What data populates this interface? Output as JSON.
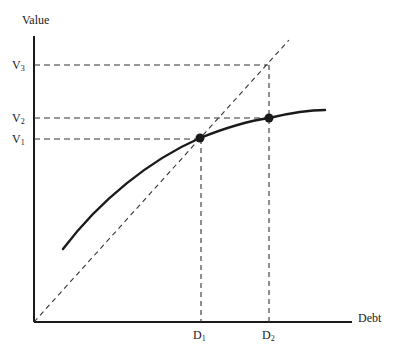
{
  "diagram": {
    "y_axis_label": "Value",
    "x_axis_label": "Debt",
    "y_ticks": [
      {
        "base": "V",
        "sub": "3"
      },
      {
        "base": "V",
        "sub": "2"
      },
      {
        "base": "V",
        "sub": "1"
      }
    ],
    "x_ticks": [
      {
        "base": "D",
        "sub": "1"
      },
      {
        "base": "D",
        "sub": "2"
      }
    ],
    "elements": {
      "curve": "value of firm vs debt (concave)",
      "diagonal": "45-degree dashed reference line",
      "points": [
        "(D1, V1)",
        "(D2, V2)"
      ],
      "guides": [
        "V3 at D2 on diagonal"
      ]
    },
    "colors": {
      "ink": "#1a1a1a",
      "background": "#ffffff"
    }
  }
}
